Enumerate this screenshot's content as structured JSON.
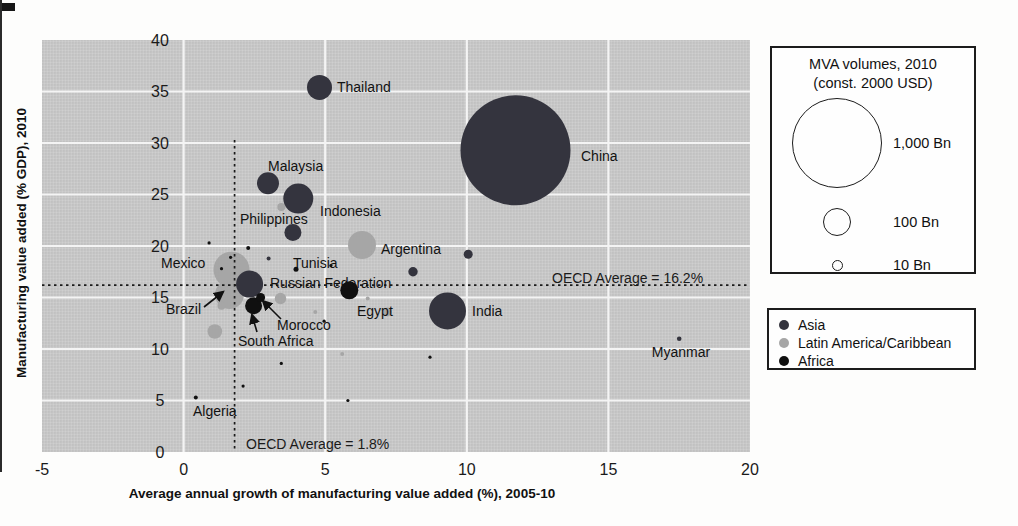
{
  "figure": {
    "background": "#fdfdfc",
    "plot_background": "#c9c9c9",
    "gridline_color": "#f4f4f4"
  },
  "chart_data": {
    "type": "scatter",
    "subtype": "bubble",
    "title": "",
    "xlabel": "Average annual growth of manufacturing value added (%), 2005-10",
    "ylabel": "Manufacturing value added (% GDP), 2010",
    "xlim": [
      -5,
      20
    ],
    "ylim": [
      0,
      40
    ],
    "x_ticks": [
      "-5",
      "0",
      "5",
      "10",
      "15",
      "20"
    ],
    "x_tick_values": [
      -5,
      0,
      5,
      10,
      15,
      20
    ],
    "y_ticks": [
      "0",
      "5",
      "10",
      "15",
      "20",
      "25",
      "30",
      "35",
      "40"
    ],
    "y_tick_values": [
      0,
      5,
      10,
      15,
      20,
      25,
      30,
      35,
      40
    ],
    "grid": true,
    "size_meaning": "bubble size = MVA volume, 2010 (const. 2000 USD)",
    "reference_lines": [
      {
        "orientation": "horizontal",
        "value": 16.2,
        "label": "OECD Average = 16.2%",
        "label_px": [
          552,
          283
        ]
      },
      {
        "orientation": "vertical",
        "value": 1.8,
        "label": "OECD Average = 1.8%",
        "label_px": [
          246,
          449
        ]
      }
    ],
    "series": [
      {
        "name": "Asia",
        "color": "#34343e",
        "points": [
          {
            "label": "China",
            "x": 11.72,
            "y": 29.3,
            "r": 55,
            "anchor": "start",
            "lx": 581,
            "ly": 161
          },
          {
            "label": "India",
            "x": 9.32,
            "y": 13.7,
            "r": 18.5,
            "anchor": "start",
            "lx": 472,
            "ly": 316
          },
          {
            "label": "Thailand",
            "x": 4.8,
            "y": 35.4,
            "r": 12.5,
            "anchor": "start",
            "lx": 337,
            "ly": 92
          },
          {
            "label": "Indonesia",
            "x": 4.05,
            "y": 24.6,
            "r": 15,
            "anchor": "start",
            "lx": 320,
            "ly": 216
          },
          {
            "label": "Malaysia",
            "x": 2.98,
            "y": 26.1,
            "r": 11,
            "anchor": "start",
            "lx": 268,
            "ly": 171
          },
          {
            "label": "Philippines",
            "x": 3.86,
            "y": 21.3,
            "r": 8.5,
            "anchor": "start",
            "lx": 240,
            "ly": 224
          },
          {
            "label": "Russian Federation",
            "x": 2.33,
            "y": 16.3,
            "r": 13.5,
            "anchor": "start",
            "lx": 270,
            "ly": 288
          },
          {
            "label": "Myanmar",
            "x": 17.5,
            "y": 11.0,
            "r": 2.3,
            "anchor": "middle",
            "lx": 681,
            "ly": 357
          },
          {
            "label": "",
            "x": 10.05,
            "y": 19.2,
            "r": 4.5
          },
          {
            "label": "",
            "x": 8.1,
            "y": 17.5,
            "r": 4.7
          },
          {
            "label": "",
            "x": 3.0,
            "y": 18.8,
            "r": 2
          }
        ]
      },
      {
        "name": "Latin America/Caribbean",
        "color": "#a6a6a6",
        "points": [
          {
            "label": "Mexico",
            "x": 1.69,
            "y": 17.7,
            "r": 18,
            "anchor": "start",
            "lx": 161,
            "ly": 268
          },
          {
            "label": "Argentina",
            "x": 6.3,
            "y": 20.1,
            "r": 14,
            "anchor": "start",
            "lx": 381,
            "ly": 254
          },
          {
            "label": "Brazil",
            "x": 1.62,
            "y": 15.3,
            "r": 14.5,
            "anchor": "start",
            "lx": 166,
            "ly": 314
          },
          {
            "label": "",
            "x": 3.42,
            "y": 14.9,
            "r": 5.7
          },
          {
            "label": "",
            "x": 1.34,
            "y": 14.2,
            "r": 4
          },
          {
            "label": "",
            "x": 1.1,
            "y": 11.7,
            "r": 7.3
          },
          {
            "label": "",
            "x": 3.45,
            "y": 23.8,
            "r": 4
          },
          {
            "label": "",
            "x": 7.2,
            "y": 13.6,
            "r": 4.3
          },
          {
            "label": "",
            "x": 5.6,
            "y": 9.5,
            "r": 2
          },
          {
            "label": "",
            "x": 6.5,
            "y": 14.9,
            "r": 2
          },
          {
            "label": "",
            "x": 4.65,
            "y": 13.6,
            "r": 2
          }
        ]
      },
      {
        "name": "Africa",
        "color": "#101010",
        "points": [
          {
            "label": "South Africa",
            "x": 2.47,
            "y": 14.2,
            "r": 8.5,
            "anchor": "start",
            "lx": 238,
            "ly": 346
          },
          {
            "label": "Morocco",
            "x": 2.72,
            "y": 15.0,
            "r": 4.5,
            "anchor": "start",
            "lx": 277,
            "ly": 330
          },
          {
            "label": "Egypt",
            "x": 5.85,
            "y": 15.7,
            "r": 9,
            "anchor": "start",
            "lx": 357,
            "ly": 316
          },
          {
            "label": "Tunisia",
            "x": 3.97,
            "y": 17.75,
            "r": 2.5,
            "anchor": "start",
            "lx": 293,
            "ly": 268
          },
          {
            "label": "Algeria",
            "x": 0.43,
            "y": 5.3,
            "r": 2,
            "anchor": "start",
            "lx": 193,
            "ly": 416
          },
          {
            "label": "",
            "x": 3.45,
            "y": 8.6,
            "r": 1.6
          },
          {
            "label": "",
            "x": 2.1,
            "y": 6.4,
            "r": 1.6
          },
          {
            "label": "",
            "x": 5.8,
            "y": 5.0,
            "r": 1.6
          },
          {
            "label": "",
            "x": 8.7,
            "y": 9.2,
            "r": 1.6
          },
          {
            "label": "",
            "x": 1.34,
            "y": 17.8,
            "r": 1.6
          },
          {
            "label": "",
            "x": 1.66,
            "y": 18.9,
            "r": 1.6
          },
          {
            "label": "",
            "x": 2.28,
            "y": 19.8,
            "r": 2
          },
          {
            "label": "",
            "x": 0.9,
            "y": 20.3,
            "r": 1.6
          },
          {
            "label": "",
            "x": 4.96,
            "y": 12.7,
            "r": 1.6
          },
          {
            "label": "",
            "x": 5.2,
            "y": 18.1,
            "r": 1.6
          }
        ]
      }
    ],
    "annotations": {
      "arrows": [
        {
          "for": "Brazil",
          "x1": 204,
          "y1": 307,
          "x2": 223,
          "y2": 292
        },
        {
          "for": "South Africa",
          "x1": 257,
          "y1": 332,
          "x2": 252,
          "y2": 315
        },
        {
          "for": "Morocco",
          "x1": 281,
          "y1": 319,
          "x2": 263,
          "y2": 301
        }
      ]
    },
    "legend_position": "right"
  },
  "size_legend": {
    "title_line1": "MVA volumes, 2010",
    "title_line2": "(const. 2000 USD)",
    "items": [
      {
        "label": "1,000 Bn",
        "r": 45
      },
      {
        "label": "100 Bn",
        "r": 14
      },
      {
        "label": "10 Bn",
        "r": 5.5
      }
    ]
  },
  "color_legend": {
    "items": [
      {
        "label": "Asia",
        "color": "#34343e"
      },
      {
        "label": "Latin America/Caribbean",
        "color": "#a6a6a6"
      },
      {
        "label": "Africa",
        "color": "#101010"
      }
    ]
  }
}
